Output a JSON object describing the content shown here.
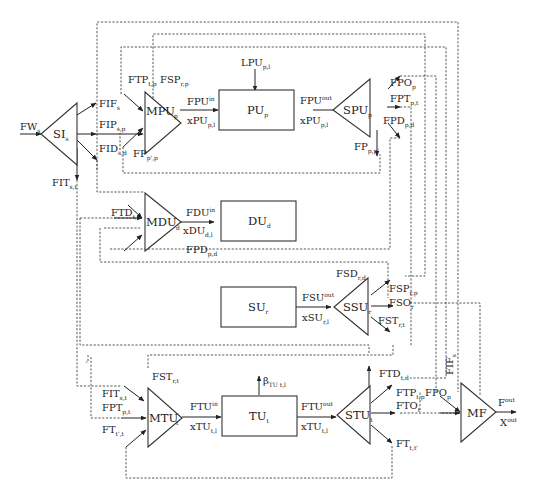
{
  "diagram": {
    "title": "",
    "nodes": {
      "SI": {
        "base": "SI",
        "sub": "s",
        "type": "splitter"
      },
      "MPU": {
        "base": "MPU",
        "sub": "p",
        "type": "mixer"
      },
      "PU": {
        "base": "PU",
        "sub": "p",
        "type": "unit"
      },
      "SPU": {
        "base": "SPU",
        "sub": "p",
        "type": "splitter"
      },
      "MDU": {
        "base": "MDU",
        "sub": "d",
        "type": "mixer"
      },
      "DU": {
        "base": "DU",
        "sub": "d",
        "type": "unit"
      },
      "SU": {
        "base": "SU",
        "sub": "r",
        "type": "unit"
      },
      "SSU": {
        "base": "SSU",
        "sub": "r",
        "type": "splitter"
      },
      "MTU": {
        "base": "MTU",
        "sub": "t",
        "type": "mixer"
      },
      "TU": {
        "base": "TU",
        "sub": "t",
        "type": "unit"
      },
      "STU": {
        "base": "STU",
        "sub": "t",
        "type": "splitter"
      },
      "MF": {
        "base": "MF",
        "sub": "",
        "type": "mixer"
      }
    },
    "labels": {
      "FW": {
        "base": "FW",
        "sub": "s",
        "sup": ""
      },
      "FIF": {
        "base": "FIF",
        "sub": "s",
        "sup": ""
      },
      "FIP": {
        "base": "FIP",
        "sub": "s,p",
        "sup": ""
      },
      "FID": {
        "base": "FID",
        "sub": "s,d",
        "sup": ""
      },
      "FIT": {
        "base": "FIT",
        "sub": "s,t",
        "sup": ""
      },
      "FTP_top": {
        "base": "FTP",
        "sub": "t,p",
        "sup": ""
      },
      "FSP_top": {
        "base": "FSP",
        "sub": "r,p",
        "sup": ""
      },
      "FP_in": {
        "base": "FP",
        "sub": "p',p",
        "sup": ""
      },
      "FPU_in": {
        "base": "FPU",
        "sub": "p",
        "sup": "in"
      },
      "xPU_in": {
        "base": "xPU",
        "sub": "p,l",
        "sup": "in"
      },
      "LPU": {
        "base": "LPU",
        "sub": "p,l",
        "sup": ""
      },
      "FPU_out": {
        "base": "FPU",
        "sub": "p",
        "sup": "out"
      },
      "xPU_out": {
        "base": "xPU",
        "sub": "p,l",
        "sup": "out"
      },
      "FPO": {
        "base": "FPO",
        "sub": "p",
        "sup": ""
      },
      "FPT": {
        "base": "FPT",
        "sub": "p,t",
        "sup": ""
      },
      "FPD": {
        "base": "FPD",
        "sub": "p,d",
        "sup": ""
      },
      "FP_out": {
        "base": "FP",
        "sub": "p,p'",
        "sup": ""
      },
      "FTD_in": {
        "base": "FTD",
        "sub": "t,d",
        "sup": ""
      },
      "FDU_in": {
        "base": "FDU",
        "sub": "d",
        "sup": "in"
      },
      "xDU_in": {
        "base": "xDU",
        "sub": "d,l",
        "sup": "in"
      },
      "FPD_mid": {
        "base": "FPD",
        "sub": "p,d",
        "sup": ""
      },
      "FSD": {
        "base": "FSD",
        "sub": "r,d",
        "sup": ""
      },
      "FSU_out": {
        "base": "FSU",
        "sub": "r",
        "sup": "out"
      },
      "xSU_out": {
        "base": "xSU",
        "sub": "r,l",
        "sup": "out"
      },
      "FSP": {
        "base": "FSP",
        "sub": "r,p",
        "sup": ""
      },
      "FSO": {
        "base": "FSO",
        "sub": "r",
        "sup": ""
      },
      "FST": {
        "base": "FST",
        "sub": "r,t",
        "sup": ""
      },
      "FST_in": {
        "base": "FST",
        "sub": "r,t",
        "sup": ""
      },
      "FIT_in": {
        "base": "FIT",
        "sub": "s,t",
        "sup": ""
      },
      "FPT_in": {
        "base": "FPT",
        "sub": "p,t",
        "sup": ""
      },
      "FT_in": {
        "base": "FT",
        "sub": "t',t",
        "sup": ""
      },
      "FTU_in": {
        "base": "FTU",
        "sub": "t",
        "sup": "in"
      },
      "xTU_in": {
        "base": "xTU",
        "sub": "t,l",
        "sup": "in"
      },
      "beta": {
        "base": "β",
        "sub": "TU t,l",
        "sup": ""
      },
      "FTU_out": {
        "base": "FTU",
        "sub": "t",
        "sup": "out"
      },
      "xTU_out": {
        "base": "xTU",
        "sub": "t,l",
        "sup": "out"
      },
      "FTD_out": {
        "base": "FTD",
        "sub": "t,d",
        "sup": ""
      },
      "FTP_out": {
        "base": "FTP",
        "sub": "t,p",
        "sup": ""
      },
      "FTO": {
        "base": "FTO",
        "sub": "t",
        "sup": ""
      },
      "FT_out": {
        "base": "FT",
        "sub": "t,t'",
        "sup": ""
      },
      "FPO_mf": {
        "base": "FPO",
        "sub": "p",
        "sup": ""
      },
      "FIF_mf": {
        "base": "FIF",
        "sub": "s",
        "sup": ""
      },
      "Fout": {
        "base": "F",
        "sub": "",
        "sup": "out"
      },
      "Xout": {
        "base": "X",
        "sub": "l",
        "sup": "out"
      }
    }
  }
}
